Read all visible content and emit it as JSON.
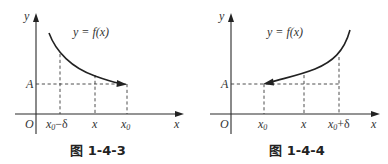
{
  "figures": [
    {
      "caption": "图 1-4-3",
      "function_label": "y = f(x)",
      "y_axis_label": "y",
      "x_axis_label": "x",
      "origin_label": "O",
      "level_label": "A",
      "x_ticks": [
        {
          "main": "x",
          "sub": "0",
          "suffix": "−δ"
        },
        {
          "main": "x",
          "sub": "",
          "suffix": ""
        },
        {
          "main": "x",
          "sub": "0",
          "suffix": ""
        }
      ],
      "curve": "decreasing, approaching A from the left as x → x0⁻"
    },
    {
      "caption": "图 1-4-4",
      "function_label": "y = f(x)",
      "y_axis_label": "y",
      "x_axis_label": "x",
      "origin_label": "O",
      "level_label": "A",
      "x_ticks": [
        {
          "main": "x",
          "sub": "0",
          "suffix": ""
        },
        {
          "main": "x",
          "sub": "",
          "suffix": ""
        },
        {
          "main": "x",
          "sub": "0",
          "suffix": "+δ"
        }
      ],
      "curve": "increasing, approaching A from the right as x → x0⁺"
    }
  ],
  "colors": {
    "ink": "#2a2a2a",
    "background": "#ffffff"
  }
}
